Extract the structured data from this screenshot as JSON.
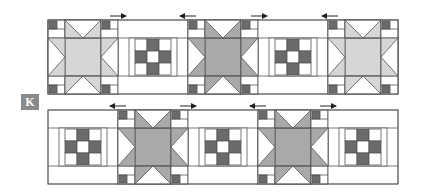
{
  "figure": {
    "label": "K"
  },
  "colors": {
    "outline": "#555555",
    "white": "#ffffff",
    "light_gray": "#d6d6d6",
    "medium_gray": "#a9a9a9",
    "dark_gray": "#6b6b6b",
    "label_bg": "#8a8a8a"
  },
  "rows": [
    {
      "name": "top-row",
      "blocks": [
        "corner-column",
        "star-light",
        "corner-column",
        "ninepatch",
        "corner-column",
        "star-medium",
        "corner-column",
        "ninepatch",
        "corner-column",
        "star-light",
        "corner-column"
      ],
      "arrows": [
        {
          "direction": "right"
        },
        {
          "direction": "left"
        },
        {
          "direction": "right"
        },
        {
          "direction": "left"
        }
      ]
    },
    {
      "name": "bottom-row",
      "blocks": [
        "ninepatch",
        "corner-column",
        "star-medium",
        "corner-column",
        "ninepatch",
        "corner-column",
        "star-medium",
        "corner-column",
        "ninepatch"
      ],
      "arrows": [
        {
          "direction": "left"
        },
        {
          "direction": "right"
        },
        {
          "direction": "left"
        },
        {
          "direction": "right"
        }
      ]
    }
  ]
}
